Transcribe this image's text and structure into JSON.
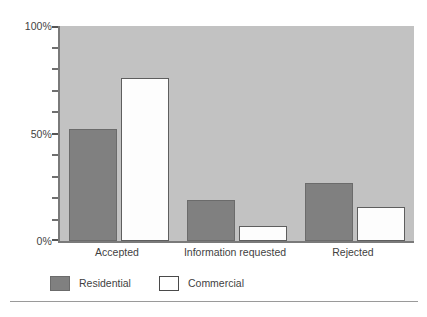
{
  "chart_data": {
    "type": "bar",
    "title": "",
    "xlabel": "",
    "ylabel": "",
    "categories": [
      "Accepted",
      "Information requested",
      "Rejected"
    ],
    "series": [
      {
        "name": "Residential",
        "color": "#808080",
        "values": [
          52,
          19,
          27
        ]
      },
      {
        "name": "Commercial",
        "color": "#ffffff",
        "values": [
          76,
          7,
          16
        ]
      }
    ],
    "ylim": [
      0,
      100
    ],
    "y_tick_labels": [
      "0%",
      "50%",
      "100%"
    ],
    "y_tick_values": [
      0,
      50,
      100
    ],
    "y_minor_tick_values": [
      10,
      20,
      30,
      40,
      60,
      70,
      80,
      90
    ],
    "grid": false,
    "legend_position": "bottom-left",
    "value_suffix": "%",
    "plot_background": "#c2c2c2",
    "axis_color": "#7a7a7a"
  },
  "legend": {
    "entries": [
      {
        "label": "Residential"
      },
      {
        "label": "Commercial"
      }
    ]
  }
}
